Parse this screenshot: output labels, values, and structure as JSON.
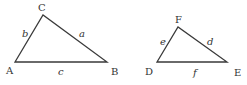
{
  "diagram": {
    "type": "similar-triangles",
    "triangles": [
      {
        "id": "triangle-abc",
        "vertices": [
          {
            "label": "A",
            "x": 15,
            "y": 62,
            "lx": 6,
            "ly": 74
          },
          {
            "label": "B",
            "x": 107,
            "y": 62,
            "lx": 111,
            "ly": 75
          },
          {
            "label": "C",
            "x": 43,
            "y": 15,
            "lx": 38,
            "ly": 11
          }
        ],
        "sides": [
          {
            "label": "a",
            "from": "C",
            "to": "B",
            "lx": 79,
            "ly": 37
          },
          {
            "label": "b",
            "from": "A",
            "to": "C",
            "lx": 22,
            "ly": 37
          },
          {
            "label": "c",
            "from": "A",
            "to": "B",
            "lx": 58,
            "ly": 75
          }
        ]
      },
      {
        "id": "triangle-def",
        "vertices": [
          {
            "label": "D",
            "x": 157,
            "y": 62,
            "lx": 145,
            "ly": 75
          },
          {
            "label": "E",
            "x": 227,
            "y": 62,
            "lx": 234,
            "ly": 76
          },
          {
            "label": "F",
            "x": 178,
            "y": 27,
            "lx": 175,
            "ly": 23
          }
        ],
        "sides": [
          {
            "label": "d",
            "from": "F",
            "to": "E",
            "lx": 207,
            "ly": 45
          },
          {
            "label": "e",
            "from": "D",
            "to": "F",
            "lx": 160,
            "ly": 45
          },
          {
            "label": "f",
            "from": "D",
            "to": "E",
            "lx": 193,
            "ly": 76
          }
        ]
      }
    ],
    "colors": {
      "stroke": "#3a3a3a",
      "text": "#333333",
      "background": "#ffffff"
    }
  }
}
